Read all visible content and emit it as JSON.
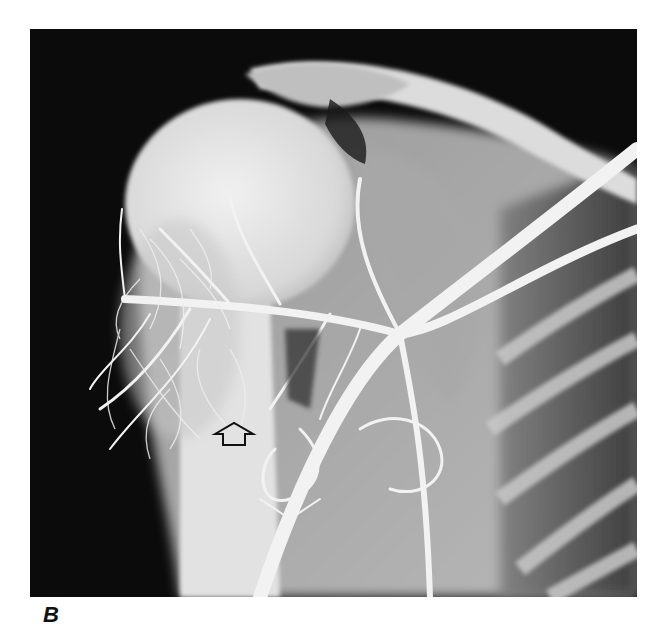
{
  "figure": {
    "panel_label": "B",
    "image_type": "angiogram",
    "annotation": {
      "type": "outlined-arrow",
      "direction": "up",
      "position_px": {
        "x": 234,
        "y": 434
      }
    },
    "colors": {
      "background": "#ffffff",
      "film_dark": "#0b0b0b",
      "bone_light": "#e6e6e6",
      "vessel": "#f4f4f4",
      "soft_tissue": "#8a8a8a",
      "arrow_stroke": "#111111"
    }
  }
}
